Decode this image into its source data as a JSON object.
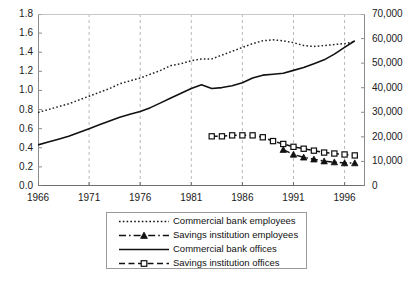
{
  "chart_data": {
    "type": "line",
    "title": "",
    "xlabel": "",
    "ylabel": "",
    "x_ticks": [
      "1966",
      "1971",
      "1976",
      "1981",
      "1986",
      "1991",
      "1996"
    ],
    "xlim": [
      1966,
      1998
    ],
    "left_axis": {
      "label": "",
      "ylim": [
        0.0,
        1.8
      ],
      "ticks": [
        "0.0",
        "0.2",
        "0.4",
        "0.6",
        "0.8",
        "1.0",
        "1.2",
        "1.4",
        "1.6",
        "1.8"
      ]
    },
    "right_axis": {
      "label": "",
      "ylim": [
        0,
        70000
      ],
      "ticks": [
        "0",
        "10,000",
        "20,000",
        "30,000",
        "40,000",
        "50,000",
        "60,000",
        "70,000"
      ]
    },
    "grid": "vertical-dashed",
    "legend_position": "below-center",
    "series": [
      {
        "name": "Commercial bank employees",
        "axis": "left",
        "style": "dotted",
        "marker": "none",
        "color": "#222222",
        "x": [
          1966,
          1967,
          1968,
          1969,
          1970,
          1971,
          1972,
          1973,
          1974,
          1975,
          1976,
          1977,
          1978,
          1979,
          1980,
          1981,
          1982,
          1983,
          1984,
          1985,
          1986,
          1987,
          1988,
          1989,
          1990,
          1991,
          1992,
          1993,
          1994,
          1995,
          1996,
          1997
        ],
        "values": [
          0.77,
          0.8,
          0.83,
          0.86,
          0.9,
          0.94,
          0.98,
          1.02,
          1.07,
          1.1,
          1.13,
          1.17,
          1.21,
          1.26,
          1.28,
          1.31,
          1.33,
          1.33,
          1.37,
          1.41,
          1.45,
          1.49,
          1.52,
          1.53,
          1.52,
          1.5,
          1.47,
          1.46,
          1.47,
          1.48,
          1.49,
          1.51
        ]
      },
      {
        "name": "Savings institution employees",
        "axis": "left",
        "style": "dash-dot",
        "marker": "triangle",
        "color": "#111111",
        "x": [
          1990,
          1991,
          1992,
          1993,
          1994,
          1995,
          1996,
          1997
        ],
        "values": [
          0.38,
          0.33,
          0.3,
          0.28,
          0.26,
          0.25,
          0.24,
          0.24
        ]
      },
      {
        "name": "Commercial bank offices",
        "axis": "left",
        "style": "solid",
        "marker": "none",
        "color": "#111111",
        "x": [
          1966,
          1967,
          1968,
          1969,
          1970,
          1971,
          1972,
          1973,
          1974,
          1975,
          1976,
          1977,
          1978,
          1979,
          1980,
          1981,
          1982,
          1983,
          1984,
          1985,
          1986,
          1987,
          1988,
          1989,
          1990,
          1991,
          1992,
          1993,
          1994,
          1995,
          1996,
          1997
        ],
        "values": [
          0.43,
          0.46,
          0.49,
          0.52,
          0.56,
          0.6,
          0.64,
          0.68,
          0.72,
          0.75,
          0.78,
          0.82,
          0.87,
          0.92,
          0.97,
          1.02,
          1.06,
          1.02,
          1.03,
          1.05,
          1.08,
          1.13,
          1.16,
          1.17,
          1.18,
          1.21,
          1.24,
          1.28,
          1.32,
          1.38,
          1.45,
          1.52
        ]
      },
      {
        "name": "Savings institution offices",
        "axis": "left",
        "style": "dashed",
        "marker": "square",
        "color": "#111111",
        "x": [
          1983,
          1984,
          1985,
          1986,
          1987,
          1988,
          1989,
          1990,
          1991,
          1992,
          1993,
          1994,
          1995,
          1996,
          1997
        ],
        "values": [
          0.52,
          0.52,
          0.53,
          0.53,
          0.53,
          0.51,
          0.47,
          0.44,
          0.41,
          0.39,
          0.37,
          0.35,
          0.34,
          0.33,
          0.32
        ]
      }
    ],
    "legend_entries": [
      {
        "label": "Commercial bank employees",
        "style": "dotted",
        "marker": "none"
      },
      {
        "label": "Savings institution employees",
        "style": "dash-dot",
        "marker": "triangle"
      },
      {
        "label": "Commercial bank offices",
        "style": "solid",
        "marker": "none"
      },
      {
        "label": "Savings institution offices",
        "style": "dashed",
        "marker": "square"
      }
    ]
  }
}
